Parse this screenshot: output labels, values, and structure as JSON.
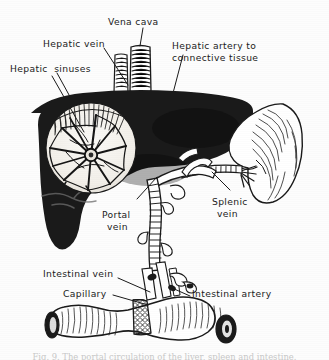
{
  "figure": {
    "medium": "black-and-white halftone anatomical illustration",
    "background_color": "#fdfdfd",
    "ink_color": "#111111",
    "organ_fill_color": "#1a1a1a",
    "inset_fill_color": "#f4f2ee"
  },
  "labels": {
    "vena_cava": "Vena cava",
    "hepatic_vein": "Hepatic vein",
    "hepatic_sinuses": "Hepatic  sinuses",
    "hepatic_artery_line1": "Hepatic artery to",
    "hepatic_artery_line2": "connective tissue",
    "portal_vein_line1": "Portal",
    "portal_vein_line2": "vein",
    "splenic_vein_line1": "Splenic",
    "splenic_vein_line2": "vein",
    "intestinal_vein": "Intestinal vein",
    "capillary": "Capillary",
    "intestinal_artery": "Intestinal artery"
  },
  "caption": {
    "text": "Fig. 9.  The portal circulation of the liver, spleen and intestine.",
    "state": "cropped"
  },
  "structures": {
    "liver": "liver",
    "spleen": "spleen",
    "intestine": "intestine",
    "vena_cava_tube": "vena cava",
    "hepatic_vein_tube": "hepatic vein",
    "portal_vein_tube": "portal vein",
    "splenic_vein_tube": "splenic vein",
    "intestinal_vein_tube": "intestinal vein",
    "intestinal_artery_tube": "intestinal artery",
    "capillary_band": "capillary bed",
    "sinuses_inset": "hepatic sinuses inset"
  }
}
